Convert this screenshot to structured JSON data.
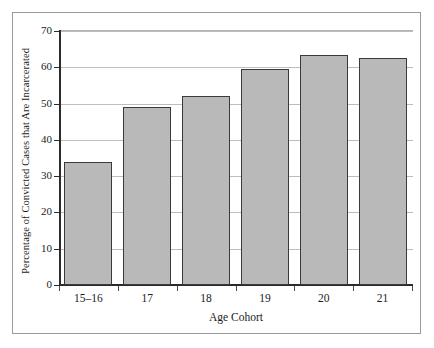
{
  "chart_data": {
    "type": "bar",
    "title": "",
    "xlabel": "Age Cohort",
    "ylabel": "Percentage of Convicted Cases that Are Incarcerated",
    "categories": [
      "15–16",
      "17",
      "18",
      "19",
      "20",
      "21"
    ],
    "values": [
      34,
      49,
      52,
      59.5,
      63.5,
      62.5
    ],
    "ylim": [
      0,
      70
    ],
    "yticks": [
      0,
      10,
      20,
      30,
      40,
      50,
      60,
      70
    ],
    "ytick_labels": [
      "0",
      "10",
      "20",
      "30",
      "40",
      "50",
      "60",
      "70"
    ],
    "grid": true,
    "grid_axis": "y",
    "legend": null,
    "bar_fill_color": "#b9b9b9",
    "bar_edge_color": "#3a3a3a",
    "gridline_color": "#bdbdbd",
    "axis_color": "#2b2b2b",
    "frame_color": "#9a9a9a",
    "background_color": "#ffffff"
  }
}
